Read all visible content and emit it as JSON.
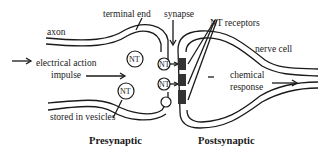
{
  "diagram": {
    "labels": {
      "axon": "axon",
      "terminal_end": "terminal end",
      "synapse": "synapse",
      "nt_receptors": "NT receptors",
      "nerve_cell": "nerve cell",
      "electrical_action": "electrical action",
      "impulse": "impulse",
      "chemical": "chemical",
      "response": "response",
      "stored_in_vesicles": "stored in vesicles",
      "presynaptic": "Presynaptic",
      "postsynaptic": "Postsynaptic"
    },
    "vesicle_label": "NT",
    "colors": {
      "ink": "#1a1a1a",
      "background": "#ffffff"
    }
  }
}
